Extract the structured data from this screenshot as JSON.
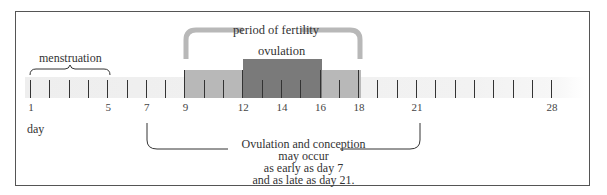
{
  "diagram": {
    "type": "timeline",
    "labels": {
      "menstruation": "menstruation",
      "fertility": "period of fertility",
      "ovulation": "ovulation",
      "axis_unit": "day"
    },
    "days": {
      "start": 1,
      "end": 28
    },
    "tick_labels": [
      "1",
      "5",
      "7",
      "9",
      "12",
      "14",
      "16",
      "18",
      "21",
      "28"
    ],
    "tick_label_days": [
      1,
      5,
      7,
      9,
      12,
      14,
      16,
      18,
      21,
      28
    ],
    "segments": [
      {
        "name": "menstruation",
        "from_day": 1,
        "to_day": 5
      },
      {
        "name": "period of fertility",
        "from_day": 9,
        "to_day": 18,
        "color": "#b8b8b8"
      },
      {
        "name": "ovulation",
        "from_day": 12,
        "to_day": 16,
        "color": "#7a7a7a"
      }
    ],
    "note": {
      "line1": "Ovulation and conception",
      "line2": "may  occur",
      "line3": "as early as day 7",
      "line4": "and as late as day 21."
    },
    "note_range": {
      "from_day": 7,
      "to_day": 21
    }
  }
}
